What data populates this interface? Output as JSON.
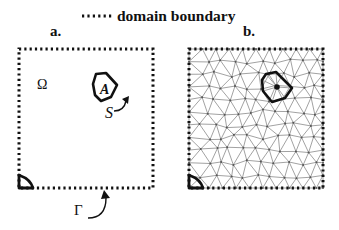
{
  "legend": {
    "boundary_style": "dotted",
    "label": "domain boundary"
  },
  "panels": [
    {
      "id": "a",
      "label": "a.",
      "domain_symbol": "Ω",
      "region_label": "A",
      "surface_label": "S",
      "boundary_label": "Γ",
      "meshed": false
    },
    {
      "id": "b",
      "label": "b.",
      "meshed": true,
      "mesh_type": "unstructured triangular",
      "has_center_node": true
    }
  ],
  "colors": {
    "ink": "#111111",
    "mesh": "#8a8a8a",
    "background": "#ffffff"
  }
}
